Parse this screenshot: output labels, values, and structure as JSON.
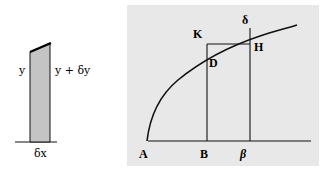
{
  "left_figure": {
    "labels": {
      "left_height": "y",
      "right_height": "y + δy",
      "width": "δx"
    },
    "colors": {
      "fill": "#c4c4c4",
      "stroke": "#111111"
    }
  },
  "right_figure": {
    "labels": {
      "origin": "A",
      "point_b": "B",
      "point_beta": "β",
      "point_k": "K",
      "point_d": "D",
      "point_h": "H",
      "point_delta": "δ"
    },
    "colors": {
      "background": "#e8e8e8",
      "stroke": "#111111"
    }
  }
}
